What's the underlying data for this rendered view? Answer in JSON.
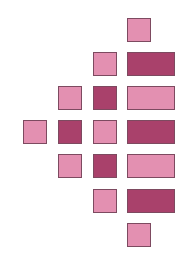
{
  "diagram": {
    "type": "block-pyramid",
    "colors": {
      "light": "#e390b1",
      "dark": "#a9416b",
      "border": "#7d4a60"
    },
    "rows": [
      {
        "row": 0,
        "cells": [
          {
            "col": 3,
            "kind": "square",
            "shade": "light"
          }
        ]
      },
      {
        "row": 1,
        "cells": [
          {
            "col": 2,
            "kind": "square",
            "shade": "light"
          },
          {
            "col": 3,
            "kind": "bar",
            "shade": "dark"
          }
        ]
      },
      {
        "row": 2,
        "cells": [
          {
            "col": 1,
            "kind": "square",
            "shade": "light"
          },
          {
            "col": 2,
            "kind": "square",
            "shade": "dark"
          },
          {
            "col": 3,
            "kind": "bar",
            "shade": "light"
          }
        ]
      },
      {
        "row": 3,
        "cells": [
          {
            "col": 0,
            "kind": "square",
            "shade": "light"
          },
          {
            "col": 1,
            "kind": "square",
            "shade": "dark"
          },
          {
            "col": 2,
            "kind": "square",
            "shade": "light"
          },
          {
            "col": 3,
            "kind": "bar",
            "shade": "dark"
          }
        ]
      },
      {
        "row": 4,
        "cells": [
          {
            "col": 1,
            "kind": "square",
            "shade": "light"
          },
          {
            "col": 2,
            "kind": "square",
            "shade": "dark"
          },
          {
            "col": 3,
            "kind": "bar",
            "shade": "light"
          }
        ]
      },
      {
        "row": 5,
        "cells": [
          {
            "col": 2,
            "kind": "square",
            "shade": "light"
          },
          {
            "col": 3,
            "kind": "bar",
            "shade": "dark"
          }
        ]
      },
      {
        "row": 6,
        "cells": [
          {
            "col": 3,
            "kind": "square",
            "shade": "light"
          }
        ]
      }
    ]
  }
}
